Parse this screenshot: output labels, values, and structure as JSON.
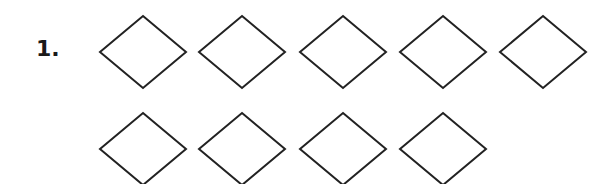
{
  "problem": {
    "number_label": "1.",
    "stroke_color": "#222222",
    "fill_color": "#ffffff",
    "shape": "diamond",
    "rows": [
      {
        "count": 5,
        "centers_x": [
          143,
          242,
          343,
          443,
          543
        ],
        "center_y": 52
      },
      {
        "count": 4,
        "centers_x": [
          143,
          242,
          343,
          443
        ],
        "center_y": 149
      }
    ],
    "diamond_half_width": 43,
    "diamond_half_height": 36,
    "total_diamonds": 9
  }
}
